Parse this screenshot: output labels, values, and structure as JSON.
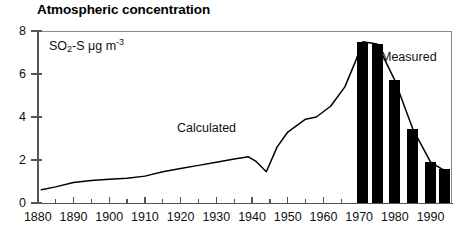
{
  "chart": {
    "title": "Atmospheric concentration",
    "y_axis_caption": {
      "pre": "SO",
      "sub": "2",
      "mid": "-S μg m",
      "sup": "-3"
    },
    "labels": {
      "calculated": "Calculated",
      "measured": "Measured"
    }
  },
  "chart_data": {
    "type": "line",
    "title": "Atmospheric concentration",
    "xlabel": "",
    "ylabel": "SO2-S µg m-3",
    "xlim": [
      1880,
      1996
    ],
    "ylim": [
      0,
      8
    ],
    "grid": false,
    "legend_position": "inline-annotation",
    "y_ticks": [
      0,
      2,
      4,
      6,
      8
    ],
    "y_tick_labels": [
      "0",
      "2",
      "4",
      "6",
      "8"
    ],
    "x_ticks": [
      1880,
      1890,
      1900,
      1910,
      1920,
      1930,
      1940,
      1950,
      1960,
      1970,
      1980,
      1990
    ],
    "x_tick_labels": [
      "1880",
      "1890",
      "1900",
      "1910",
      "1920",
      "1930",
      "1940",
      "1950",
      "1960",
      "1970",
      "1980",
      "1990"
    ],
    "x_minor_ticks": [
      1885,
      1895,
      1905,
      1915,
      1925,
      1935,
      1945,
      1955,
      1965,
      1975,
      1985,
      1995
    ],
    "series": [
      {
        "name": "Calculated",
        "type": "line",
        "x": [
          1881,
          1885,
          1890,
          1895,
          1900,
          1905,
          1910,
          1915,
          1920,
          1925,
          1930,
          1935,
          1939,
          1941,
          1944,
          1947,
          1950,
          1955,
          1958,
          1962,
          1966,
          1969,
          1971,
          1975,
          1980,
          1985,
          1990,
          1993,
          1995
        ],
        "values": [
          0.62,
          0.75,
          0.95,
          1.05,
          1.1,
          1.15,
          1.25,
          1.45,
          1.6,
          1.75,
          1.9,
          2.05,
          2.15,
          1.95,
          1.45,
          2.6,
          3.3,
          3.9,
          4.0,
          4.5,
          5.4,
          6.6,
          7.5,
          7.4,
          5.7,
          3.45,
          1.9,
          1.6,
          1.45
        ]
      },
      {
        "name": "Measured",
        "type": "bar",
        "x": [
          1971,
          1975,
          1980,
          1985,
          1990,
          1994
        ],
        "values": [
          7.5,
          7.4,
          5.7,
          3.45,
          1.9,
          1.6
        ]
      }
    ]
  }
}
